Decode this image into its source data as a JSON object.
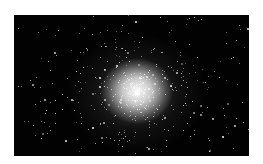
{
  "image": {
    "subject": "globular star cluster",
    "background_color": "#020202",
    "core_color": "#f4f4f4",
    "frame": {
      "x": 14,
      "y": 15,
      "width": 235,
      "height": 141
    },
    "core_center": {
      "x": 136,
      "y": 93
    }
  }
}
